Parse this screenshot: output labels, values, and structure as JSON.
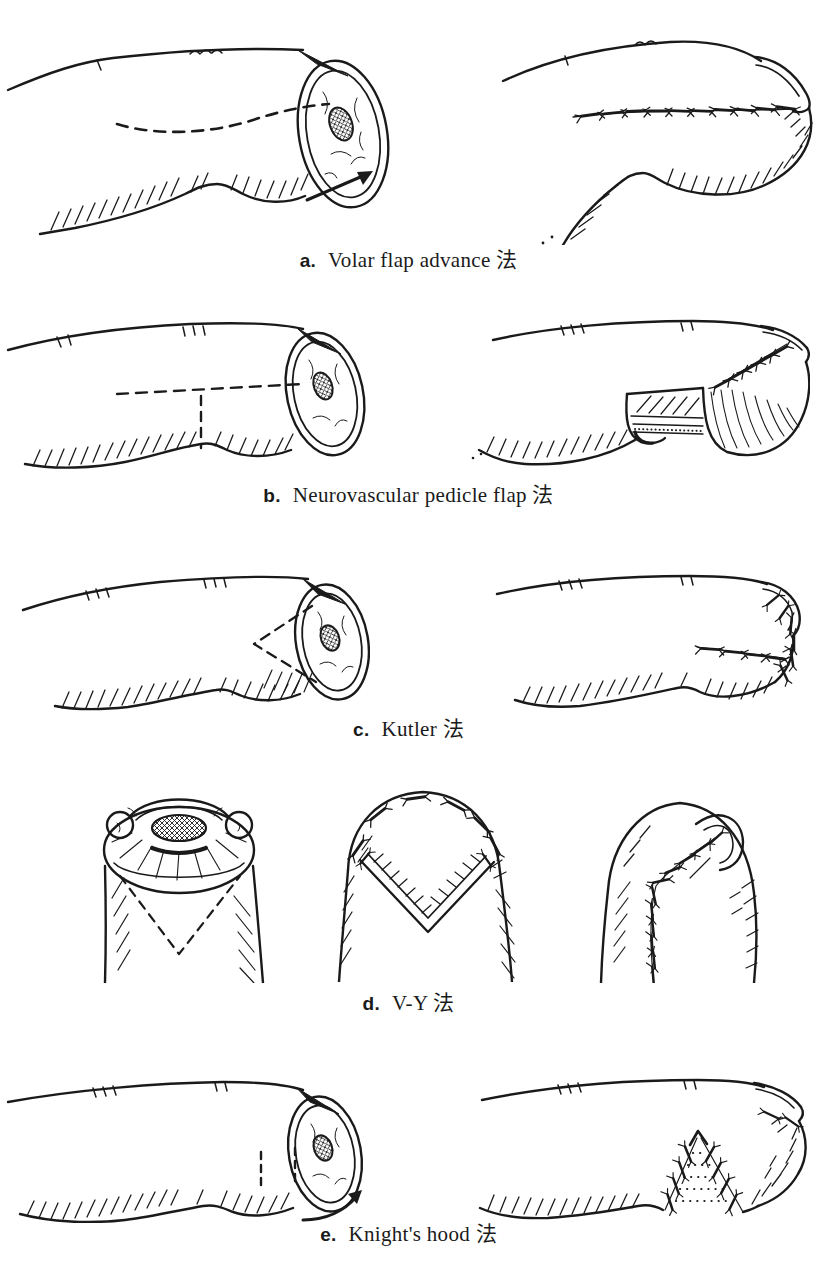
{
  "page": {
    "background": "#ffffff",
    "ink": "#1a1a1a"
  },
  "figure": {
    "rows": [
      {
        "label": "a.",
        "caption": "Volar flap advance 法",
        "panels": [
          "finger-stump-volar-dashed-incision-with-advance-arrow",
          "sutured-finger-side-view"
        ]
      },
      {
        "label": "b.",
        "caption": "Neurovascular pedicle flap 法",
        "panels": [
          "finger-stump-t-shaped-dashed-incision",
          "advanced-flap-with-pedicle-window-sutured"
        ]
      },
      {
        "label": "c.",
        "caption": "Kutler 法",
        "panels": [
          "finger-stump-lateral-v-dashed-incision",
          "lateral-flaps-sutured-fingertip"
        ]
      },
      {
        "label": "d.",
        "caption": "V-Y 法",
        "panels": [
          "fingertip-stump-end-view-dashed-v-incision",
          "v-flap-advanced-open-donor-v",
          "healed-y-suture-line"
        ]
      },
      {
        "label": "e.",
        "caption": "Knight's hood 法",
        "panels": [
          "finger-stump-two-dashed-incisions-with-curved-arrow",
          "hood-flap-sutured-with-graft-stipple"
        ]
      }
    ]
  }
}
